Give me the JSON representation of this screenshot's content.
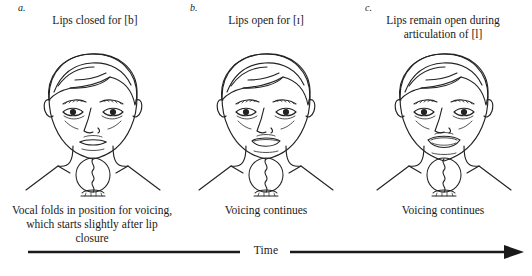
{
  "figure": {
    "colors": {
      "ink": "#1a1a1a",
      "line": "#222222",
      "background": "#ffffff"
    },
    "panels": [
      {
        "letter": "a.",
        "top_caption": "Lips closed for [b]",
        "bottom_caption": "Vocal folds in position for voicing,\nwhich starts slightly after lip closure",
        "mouth_state": "closed",
        "larynx_icon": "vocal-folds-icon"
      },
      {
        "letter": "b.",
        "top_caption": "Lips open for [ɪ]",
        "bottom_caption": "Voicing continues",
        "mouth_state": "open",
        "larynx_icon": "vocal-folds-icon"
      },
      {
        "letter": "c.",
        "top_caption": "Lips remain open during\narticulation of [l]",
        "bottom_caption": "Voicing continues",
        "mouth_state": "wide-open",
        "larynx_icon": "vocal-folds-icon"
      }
    ],
    "axis": {
      "label": "Time",
      "direction": "left-to-right",
      "arrowhead": "right"
    }
  }
}
